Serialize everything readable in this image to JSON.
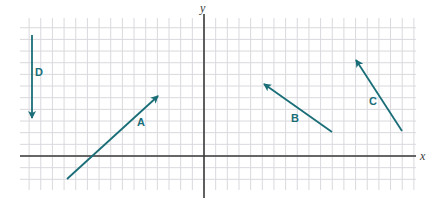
{
  "diagram": {
    "title": "",
    "grid": {
      "x0": 20,
      "y0": 18,
      "x1": 416,
      "y1": 190,
      "spacing": 11.66,
      "color": "#d9d9de"
    },
    "axes": {
      "origin_px": [
        204,
        156
      ],
      "x_label": "x",
      "y_label": "y",
      "color": "#3a3a3a"
    },
    "vector_color": "#1a6e78",
    "vectors": [
      {
        "id": "A",
        "label": "A",
        "from": [
          67,
          179
        ],
        "to": [
          158,
          96
        ],
        "label_pos": [
          137,
          126
        ]
      },
      {
        "id": "B",
        "label": "B",
        "from": [
          332,
          132
        ],
        "to": [
          264,
          84
        ],
        "label_pos": [
          291,
          122
        ]
      },
      {
        "id": "C",
        "label": "C",
        "from": [
          402,
          131
        ],
        "to": [
          356,
          60
        ],
        "label_pos": [
          369,
          105
        ]
      },
      {
        "id": "D",
        "label": "D",
        "from": [
          32,
          35
        ],
        "to": [
          32,
          118
        ],
        "label_pos": [
          35,
          76
        ]
      }
    ]
  }
}
